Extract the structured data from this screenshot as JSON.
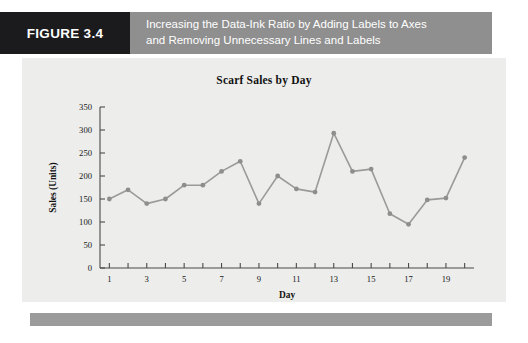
{
  "figure": {
    "tag": "FIGURE 3.4",
    "caption_line1": "Increasing the Data-Ink Ratio by Adding Labels to Axes",
    "caption_line2": "and Removing Unnecessary Lines and Labels",
    "tag_bg": "#1b1b1d",
    "caption_bg": "#8f8f8f",
    "panel_bg": "#ededeb",
    "footer_bg": "#9b9b9b"
  },
  "chart_data": {
    "type": "line",
    "title": "Scarf Sales by Day",
    "xlabel": "Day",
    "ylabel": "Sales (Units)",
    "x": [
      1,
      2,
      3,
      4,
      5,
      6,
      7,
      8,
      9,
      10,
      11,
      12,
      13,
      14,
      15,
      16,
      17,
      18,
      19,
      20
    ],
    "values": [
      150,
      170,
      140,
      150,
      180,
      180,
      210,
      232,
      140,
      200,
      172,
      165,
      293,
      210,
      215,
      118,
      95,
      148,
      152,
      240
    ],
    "xlim": [
      0.5,
      20.5
    ],
    "ylim": [
      0,
      350
    ],
    "xticks": [
      1,
      3,
      5,
      7,
      9,
      11,
      13,
      15,
      17,
      19
    ],
    "xtick_labels": [
      "1",
      "3",
      "5",
      "7",
      "9",
      "11",
      "13",
      "15",
      "17",
      "19"
    ],
    "yticks": [
      0,
      50,
      100,
      150,
      200,
      250,
      300,
      350
    ],
    "ytick_labels": [
      "0",
      "50",
      "100",
      "150",
      "200",
      "250",
      "300",
      "350"
    ],
    "grid": false,
    "legend": null,
    "series_color": "#9a9a9a",
    "marker_color": "#8e8e8e"
  }
}
